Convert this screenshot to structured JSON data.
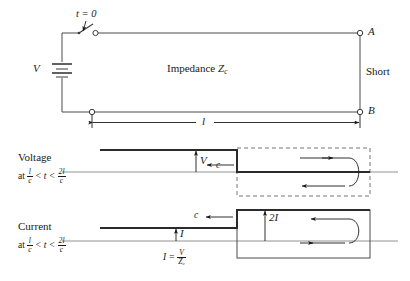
{
  "figure": {
    "type": "transmission-line-transient-diagram",
    "title_absent": true
  },
  "circuit": {
    "switch_label": "t = 0",
    "source_label": "V",
    "line_label_text": "Impedance",
    "line_label_symbol": "Z",
    "line_label_subscript": "c",
    "terminal_top": "A",
    "terminal_bottom": "B",
    "termination_label": "Short",
    "length_label": "l"
  },
  "voltage_plot": {
    "name_label": "Voltage",
    "condition_prefix": "at",
    "condition_num_1": "l",
    "condition_den_1": "c",
    "condition_rel_1": "< t <",
    "condition_num_2": "2l",
    "condition_den_2": "c",
    "amplitude_label": "V",
    "speed_label": "c",
    "speed_arrow_direction": "left",
    "reflection_arrow_top": "right",
    "reflection_arrow_bottom": "left",
    "step_position_note": "falling step",
    "region_box_style": "dashed"
  },
  "current_plot": {
    "name_label": "Current",
    "condition_prefix": "at",
    "condition_num_1": "l",
    "condition_den_1": "c",
    "condition_rel_1": "< t <",
    "condition_num_2": "2l",
    "condition_den_2": "c",
    "amplitude_label": "I",
    "amplitude_label_2": "2I",
    "speed_label": "c",
    "speed_arrow_direction": "left",
    "reflection_arrow_top": "left",
    "reflection_arrow_bottom": "right",
    "formula_lhs": "I =",
    "formula_num": "V",
    "formula_den": "Z",
    "formula_den_sub": "c",
    "step_position_note": "rising step",
    "region_box_style": "solid"
  },
  "colors": {
    "ink": "#1a1a1a",
    "trace": "#2b2b2b",
    "axis": "#555555",
    "dashed": "#777777"
  }
}
